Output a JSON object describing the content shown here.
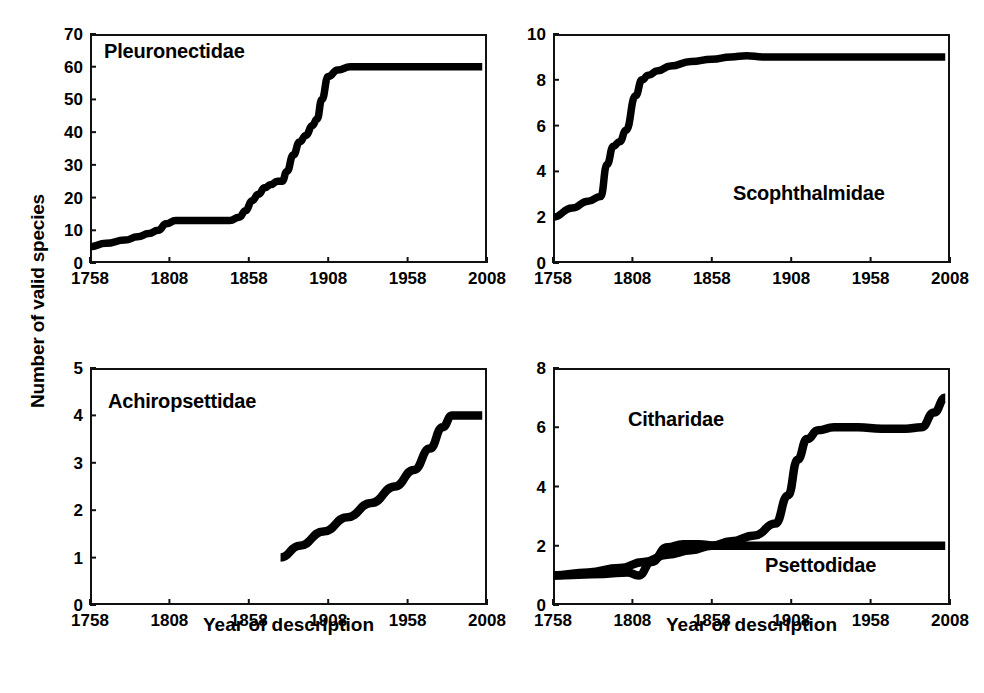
{
  "figure": {
    "y_axis_title": "Number of valid species",
    "x_axis_title_left": "Year of description",
    "x_axis_title_right": "Year of description"
  },
  "chart_data": [
    {
      "type": "line",
      "title": "Pleuronectidae",
      "panel": "top-left",
      "xlabel": "Year of description",
      "ylabel": "Number of valid species",
      "xlim": [
        1758,
        2008
      ],
      "ylim": [
        0,
        70
      ],
      "xticks": [
        1758,
        1808,
        1858,
        1908,
        1958,
        2008
      ],
      "yticks": [
        0,
        10,
        20,
        30,
        40,
        50,
        60,
        70
      ],
      "grid": false,
      "legend": "none",
      "series": [
        {
          "name": "Pleuronectidae",
          "x": [
            1758,
            1768,
            1780,
            1788,
            1795,
            1801,
            1806,
            1812,
            1820,
            1830,
            1840,
            1846,
            1852,
            1856,
            1860,
            1864,
            1868,
            1872,
            1876,
            1879,
            1882,
            1886,
            1890,
            1894,
            1898,
            1901,
            1904,
            1908,
            1914,
            1922,
            1930,
            1940,
            1950,
            1960,
            1970,
            1980,
            1990,
            2000,
            2005
          ],
          "y": [
            5,
            6,
            7,
            8,
            9,
            10,
            12,
            13,
            13,
            13,
            13,
            13,
            14,
            16,
            19,
            21,
            23,
            24,
            25,
            25,
            28,
            33,
            37,
            39,
            42,
            44,
            50,
            57,
            59,
            60,
            60,
            60,
            60,
            60,
            60,
            60,
            60,
            60,
            60
          ]
        }
      ]
    },
    {
      "type": "line",
      "title": "Scophthalmidae",
      "panel": "top-right",
      "xlabel": "Year of description",
      "ylabel": "Number of valid species",
      "xlim": [
        1758,
        2008
      ],
      "ylim": [
        0,
        10
      ],
      "xticks": [
        1758,
        1808,
        1858,
        1908,
        1958,
        2008
      ],
      "yticks": [
        0,
        2,
        4,
        6,
        8,
        10
      ],
      "grid": false,
      "legend": "none",
      "series": [
        {
          "name": "Scophthalmidae",
          "x": [
            1758,
            1770,
            1780,
            1788,
            1792,
            1796,
            1800,
            1804,
            1810,
            1814,
            1818,
            1824,
            1832,
            1845,
            1858,
            1870,
            1880,
            1890,
            1910,
            1940,
            1970,
            2000,
            2005
          ],
          "y": [
            2,
            2.4,
            2.7,
            2.9,
            4.3,
            5.1,
            5.3,
            5.8,
            7.3,
            8.0,
            8.2,
            8.4,
            8.6,
            8.8,
            8.9,
            9.0,
            9.05,
            9.0,
            9.0,
            9.0,
            9.0,
            9.0,
            9.0
          ]
        }
      ]
    },
    {
      "type": "line",
      "title": "Achiropsettidae",
      "panel": "bottom-left",
      "xlabel": "Year of description",
      "ylabel": "Number of valid species",
      "xlim": [
        1758,
        2008
      ],
      "ylim": [
        0,
        5
      ],
      "xticks": [
        1758,
        1808,
        1858,
        1908,
        1958,
        2008
      ],
      "yticks": [
        0,
        1,
        2,
        3,
        4,
        5
      ],
      "grid": false,
      "legend": "none",
      "series": [
        {
          "name": "Achiropsettidae",
          "x": [
            1878,
            1890,
            1905,
            1920,
            1935,
            1950,
            1962,
            1972,
            1980,
            1986,
            1992,
            2005
          ],
          "y": [
            1.0,
            1.25,
            1.55,
            1.85,
            2.15,
            2.5,
            2.85,
            3.3,
            3.75,
            4.0,
            4.0,
            4.0
          ]
        }
      ]
    },
    {
      "type": "line",
      "title": "Citharidae / Psettodidae",
      "panel": "bottom-right",
      "xlabel": "Year of description",
      "ylabel": "Number of valid species",
      "xlim": [
        1758,
        2008
      ],
      "ylim": [
        0,
        8
      ],
      "xticks": [
        1758,
        1808,
        1858,
        1908,
        1958,
        2008
      ],
      "yticks": [
        0,
        2,
        4,
        6,
        8
      ],
      "grid": false,
      "legend": "inline-labels",
      "series": [
        {
          "name": "Citharidae",
          "x": [
            1758,
            1780,
            1800,
            1815,
            1830,
            1845,
            1858,
            1870,
            1885,
            1898,
            1906,
            1912,
            1918,
            1925,
            1935,
            1950,
            1965,
            1980,
            1990,
            1998,
            2005
          ],
          "y": [
            1.0,
            1.1,
            1.25,
            1.45,
            1.7,
            1.85,
            2.0,
            2.15,
            2.35,
            2.75,
            3.7,
            4.9,
            5.6,
            5.9,
            6.0,
            6.0,
            5.95,
            5.95,
            6.0,
            6.5,
            7.0
          ]
        },
        {
          "name": "Psettodidae",
          "x": [
            1758,
            1790,
            1805,
            1812,
            1820,
            1830,
            1840,
            1850,
            1860,
            1880,
            1920,
            1960,
            2005
          ],
          "y": [
            1.0,
            1.05,
            1.1,
            1.0,
            1.45,
            1.95,
            2.05,
            2.05,
            2.0,
            2.0,
            2.0,
            2.0,
            2.0
          ]
        }
      ]
    }
  ],
  "panels": {
    "top_left": {
      "label": "Pleuronectidae",
      "yticks": [
        "0",
        "10",
        "20",
        "30",
        "40",
        "50",
        "60",
        "70"
      ],
      "xticks": [
        "1758",
        "1808",
        "1858",
        "1908",
        "1958",
        "2008"
      ]
    },
    "top_right": {
      "label": "Scophthalmidae",
      "yticks": [
        "0",
        "2",
        "4",
        "6",
        "8",
        "10"
      ],
      "xticks": [
        "1758",
        "1808",
        "1858",
        "1908",
        "1958",
        "2008"
      ]
    },
    "bottom_left": {
      "label": "Achiropsettidae",
      "yticks": [
        "0",
        "1",
        "2",
        "3",
        "4",
        "5"
      ],
      "xticks": [
        "1758",
        "1808",
        "1858",
        "1908",
        "1958",
        "2008"
      ]
    },
    "bottom_right": {
      "label_citharidae": "Citharidae",
      "label_psettodidae": "Psettodidae",
      "yticks": [
        "0",
        "2",
        "4",
        "6",
        "8"
      ],
      "xticks": [
        "1758",
        "1808",
        "1858",
        "1908",
        "1958",
        "2008"
      ]
    }
  }
}
